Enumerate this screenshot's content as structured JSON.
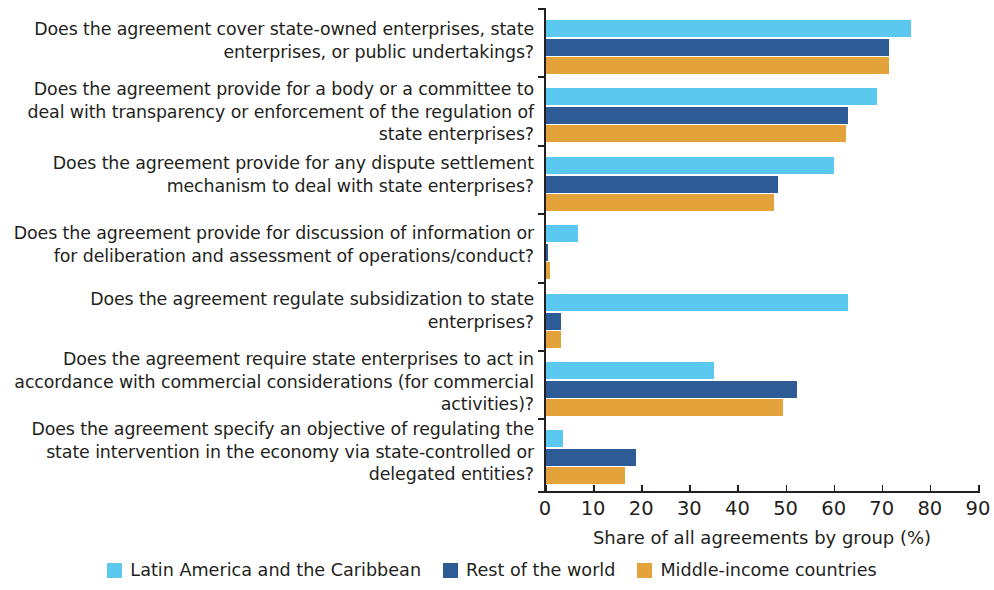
{
  "chart_data": {
    "type": "bar",
    "orientation": "horizontal",
    "title": "",
    "xlabel": "Share of all agreements by group (%)",
    "ylabel": "",
    "xlim": [
      0,
      90
    ],
    "xticks": [
      0,
      10,
      20,
      30,
      40,
      50,
      60,
      70,
      80,
      90
    ],
    "xtick_labels": [
      "0",
      "10",
      "20",
      "30",
      "40",
      "50",
      "60",
      "70",
      "80",
      "90"
    ],
    "grid": false,
    "legend_position": "bottom",
    "categories": [
      "Does the agreement cover state-owned enterprises, state enterprises, or public undertakings?",
      "Does the agreement provide for a body or a committee to deal with transparency or enforcement of the regulation of state enterprises?",
      "Does the agreement provide for any dispute settlement mechanism to deal with state enterprises?",
      "Does the agreement provide for discussion of information or for deliberation and assessment of operations/conduct?",
      "Does the agreement regulate subsidization to state enterprises?",
      "Does the agreement require state enterprises to act in accordance with commercial considerations (for commercial activities)?",
      "Does the agreement specify an objective of regulating the state intervention in the economy via state-controlled or delegated entities?"
    ],
    "series": [
      {
        "name": "Latin America and the Caribbean",
        "color": "#5bc8f0",
        "values": [
          76.0,
          69.0,
          60.0,
          6.9,
          63.0,
          35.2,
          3.7
        ]
      },
      {
        "name": "Rest of the world",
        "color": "#2d5b96",
        "values": [
          71.5,
          63.0,
          48.5,
          0.7,
          3.3,
          52.3,
          19.0
        ]
      },
      {
        "name": "Middle-income countries",
        "color": "#e3a33a",
        "values": [
          71.5,
          62.5,
          47.5,
          1.0,
          3.3,
          49.5,
          16.6
        ]
      }
    ]
  }
}
